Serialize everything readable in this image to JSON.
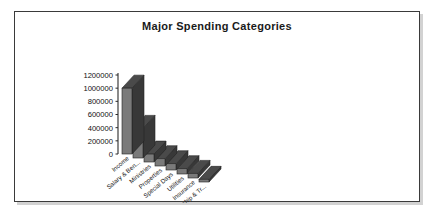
{
  "chart_data": {
    "type": "bar",
    "title": "Major Spending Categories",
    "xlabel": "",
    "ylabel": "",
    "categories": [
      "Income",
      "Salary & Ben...",
      "Ministries",
      "Properties",
      "Special Days",
      "Utilities",
      "Insurance",
      "Membership & Tr..."
    ],
    "values": [
      1000000,
      450000,
      120000,
      110000,
      95000,
      80000,
      70000,
      40000
    ],
    "ylim": [
      0,
      1200000
    ],
    "yticks": [
      0,
      200000,
      400000,
      600000,
      800000,
      1000000,
      1200000
    ],
    "ytick_labels": [
      "0",
      "200000",
      "400000",
      "600000",
      "800000",
      "1000000",
      "1200000"
    ],
    "grid": false,
    "legend": false,
    "style": "3d-column",
    "series": [
      {
        "name": "Spending",
        "values": [
          1000000,
          450000,
          120000,
          110000,
          95000,
          80000,
          70000,
          40000
        ]
      }
    ],
    "colors": {
      "bar_front": "#7a7a7a",
      "bar_top": "#4a4a4a",
      "bar_side": "#383838",
      "axis": "#2b2b2b",
      "background": "#ffffff",
      "border": "#3a3a3a",
      "shadow": "#d2d2d2",
      "text": "#101010"
    }
  }
}
